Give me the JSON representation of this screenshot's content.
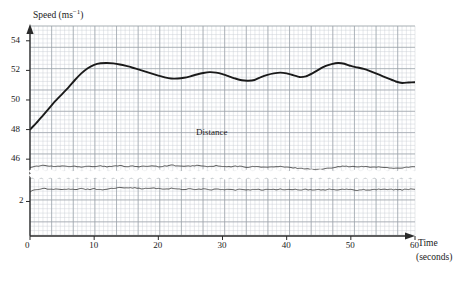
{
  "chart_data": {
    "type": "line",
    "title": "",
    "xlabel": "Time",
    "xlabel_units": "(seconds)",
    "ylabel": "Speed (ms−1)",
    "ylabel_base": "Speed (ms",
    "ylabel_exp": "−1",
    "ylabel_close": ")",
    "grid": true,
    "grid_minor": true,
    "legend_position": "inline-annotation",
    "xlim": [
      0,
      60
    ],
    "xticks": [
      0,
      10,
      20,
      30,
      40,
      50,
      60
    ],
    "xticklabels": [
      "0",
      "10",
      "20",
      "30",
      "40",
      "50",
      "60"
    ],
    "yticks": [
      46,
      48,
      50,
      52,
      54
    ],
    "yticklabels": [
      "46",
      "48",
      "50",
      "52",
      "54"
    ],
    "ylim_upper_panel": [
      45.2,
      55.0
    ],
    "axis_break": true,
    "lower_panel_yticks": [
      2
    ],
    "lower_panel_yticklabels": [
      "2"
    ],
    "lower_panel_ylim": [
      0,
      3.4
    ],
    "annotations": [
      {
        "text": "Distance",
        "x": 28,
        "y": 49.0
      }
    ],
    "series": [
      {
        "name": "Speed",
        "style": "thick-solid",
        "color": "#1a1a1a",
        "x": [
          0,
          1,
          2,
          3,
          4,
          5,
          6,
          7,
          8,
          9,
          10,
          11,
          12,
          13,
          14,
          15,
          16,
          17,
          18,
          19,
          20,
          21,
          22,
          23,
          24,
          25,
          26,
          27,
          28,
          29,
          30,
          31,
          32,
          33,
          34,
          35,
          36,
          37,
          38,
          39,
          40,
          41,
          42,
          43,
          44,
          45,
          46,
          47,
          48,
          49,
          50,
          51,
          52,
          53,
          54,
          55,
          56,
          57,
          58,
          59,
          60
        ],
        "values": [
          48.0,
          48.45,
          48.95,
          49.45,
          49.95,
          50.4,
          50.85,
          51.35,
          51.8,
          52.15,
          52.38,
          52.48,
          52.5,
          52.47,
          52.4,
          52.3,
          52.18,
          52.05,
          51.92,
          51.78,
          51.65,
          51.53,
          51.45,
          51.45,
          51.5,
          51.6,
          51.72,
          51.82,
          51.88,
          51.85,
          51.75,
          51.6,
          51.45,
          51.33,
          51.3,
          51.35,
          51.55,
          51.7,
          51.8,
          51.85,
          51.8,
          51.68,
          51.55,
          51.6,
          51.8,
          52.05,
          52.28,
          52.42,
          52.5,
          52.45,
          52.3,
          52.2,
          52.1,
          51.95,
          51.78,
          51.6,
          51.42,
          51.25,
          51.15,
          51.18,
          51.2
        ]
      },
      {
        "name": "Lower trace A",
        "style": "thin-noisy",
        "color": "#3a3a3a",
        "baseline": 45.52,
        "panel": "upper",
        "x": [
          0,
          1,
          2,
          3,
          4,
          5,
          6,
          7,
          8,
          9,
          10,
          11,
          12,
          13,
          14,
          15,
          16,
          17,
          18,
          19,
          20,
          21,
          22,
          23,
          24,
          25,
          26,
          27,
          28,
          29,
          30,
          31,
          32,
          33,
          34,
          35,
          36,
          37,
          38,
          39,
          40,
          41,
          42,
          43,
          44,
          45,
          46,
          47,
          48,
          49,
          50,
          51,
          52,
          53,
          54,
          55,
          56,
          57,
          58,
          59,
          60
        ],
        "values": [
          45.45,
          45.52,
          45.58,
          45.53,
          45.5,
          45.55,
          45.5,
          45.52,
          45.48,
          45.53,
          45.5,
          45.55,
          45.48,
          45.52,
          45.58,
          45.5,
          45.53,
          45.48,
          45.52,
          45.56,
          45.5,
          45.53,
          45.6,
          45.55,
          45.5,
          45.54,
          45.58,
          45.52,
          45.5,
          45.55,
          45.5,
          45.48,
          45.52,
          45.5,
          45.46,
          45.5,
          45.48,
          45.45,
          45.48,
          45.5,
          45.45,
          45.42,
          45.38,
          45.35,
          45.32,
          45.3,
          45.35,
          45.42,
          45.5,
          45.52,
          45.5,
          45.48,
          45.5,
          45.46,
          45.48,
          45.44,
          45.42,
          45.38,
          45.42,
          45.46,
          45.48
        ]
      },
      {
        "name": "Lower trace B",
        "style": "thin-noisy",
        "color": "#3a3a3a",
        "baseline": 2.72,
        "panel": "lower",
        "x": [
          0,
          1,
          2,
          3,
          4,
          5,
          6,
          7,
          8,
          9,
          10,
          11,
          12,
          13,
          14,
          15,
          16,
          17,
          18,
          19,
          20,
          21,
          22,
          23,
          24,
          25,
          26,
          27,
          28,
          29,
          30,
          31,
          32,
          33,
          34,
          35,
          36,
          37,
          38,
          39,
          40,
          41,
          42,
          43,
          44,
          45,
          46,
          47,
          48,
          49,
          50,
          51,
          52,
          53,
          54,
          55,
          56,
          57,
          58,
          59,
          60
        ],
        "values": [
          2.58,
          2.72,
          2.78,
          2.72,
          2.75,
          2.7,
          2.74,
          2.7,
          2.76,
          2.72,
          2.76,
          2.7,
          2.74,
          2.78,
          2.82,
          2.84,
          2.82,
          2.78,
          2.76,
          2.8,
          2.76,
          2.74,
          2.78,
          2.74,
          2.72,
          2.76,
          2.72,
          2.74,
          2.7,
          2.73,
          2.7,
          2.72,
          2.68,
          2.72,
          2.7,
          2.73,
          2.69,
          2.72,
          2.7,
          2.73,
          2.7,
          2.72,
          2.69,
          2.71,
          2.68,
          2.71,
          2.7,
          2.72,
          2.69,
          2.72,
          2.7,
          2.68,
          2.71,
          2.69,
          2.72,
          2.74,
          2.7,
          2.72,
          2.7,
          2.73,
          2.71
        ]
      }
    ],
    "colors": {
      "grid_minor": "#c9cdd4",
      "grid_major": "#9aa0a8",
      "axis": "#2a2a2a",
      "curve": "#1a1a1a"
    }
  }
}
